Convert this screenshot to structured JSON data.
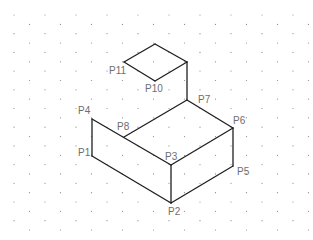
{
  "diagram": {
    "type": "isometric-drawing",
    "grid": {
      "style": "isometric-dot",
      "origin_x": 14,
      "origin_y": 15,
      "col_spacing": 31,
      "row_spacing": 9.35,
      "cols": 10,
      "rows": 24,
      "dot_color": "#8a8a8a"
    },
    "line_color": "#1f1f1f",
    "label_color": "#6e6e6e",
    "vertices": {
      "P1": [
        92,
        156
      ],
      "P2": [
        171,
        203
      ],
      "P3": [
        171,
        165
      ],
      "P4": [
        92,
        119
      ],
      "P5": [
        233,
        166
      ],
      "P6": [
        233,
        128
      ],
      "P7": [
        187,
        100
      ],
      "P8": [
        124,
        137
      ],
      "P9": [
        187,
        62
      ],
      "P10": [
        155,
        81
      ],
      "P11": [
        124,
        62
      ],
      "P12": [
        155,
        44
      ]
    },
    "edges": [
      [
        "P4",
        "P1"
      ],
      [
        "P1",
        "P2"
      ],
      [
        "P2",
        "P3"
      ],
      [
        "P3",
        "P4"
      ],
      [
        "P2",
        "P5"
      ],
      [
        "P5",
        "P6"
      ],
      [
        "P6",
        "P3"
      ],
      [
        "P6",
        "P7"
      ],
      [
        "P7",
        "P8"
      ],
      [
        "P7",
        "P9"
      ],
      [
        "P9",
        "P10"
      ],
      [
        "P10",
        "P11"
      ],
      [
        "P11",
        "P12"
      ],
      [
        "P12",
        "P9"
      ]
    ],
    "labels": [
      {
        "id": "label-p1",
        "text": "P1",
        "x": 78,
        "y": 156
      },
      {
        "id": "label-p2",
        "text": "P2",
        "x": 168,
        "y": 215
      },
      {
        "id": "label-p3",
        "text": "P3",
        "x": 165,
        "y": 160
      },
      {
        "id": "label-p4",
        "text": "P4",
        "x": 78,
        "y": 114
      },
      {
        "id": "label-p5",
        "text": "P5",
        "x": 237,
        "y": 175
      },
      {
        "id": "label-p6",
        "text": "P6",
        "x": 233,
        "y": 124
      },
      {
        "id": "label-p7",
        "text": "P7",
        "x": 198,
        "y": 103
      },
      {
        "id": "label-p8",
        "text": "P8",
        "x": 117,
        "y": 130
      },
      {
        "id": "label-p10",
        "text": "P10",
        "x": 145,
        "y": 92
      },
      {
        "id": "label-p11",
        "text": "P11",
        "x": 109,
        "y": 74
      }
    ]
  }
}
